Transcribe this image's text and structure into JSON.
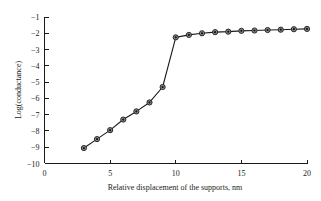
{
  "chart_data": {
    "type": "line",
    "title": "",
    "xlabel": "Relative displacement of the supports, nm",
    "ylabel": "Log(conductance)",
    "xlim": [
      0,
      20
    ],
    "ylim": [
      -10,
      -1
    ],
    "xticks": [
      0,
      5,
      10,
      15,
      20
    ],
    "xtick_labels": [
      "0",
      "5",
      "10",
      "15",
      "20"
    ],
    "yticks": [
      -1,
      -2,
      -3,
      -4,
      -5,
      -6,
      -7,
      -8,
      -9,
      -10
    ],
    "ytick_labels": [
      "−1",
      "−2",
      "−3",
      "−4",
      "−5",
      "−6",
      "−7",
      "−8",
      "−9",
      "−10"
    ],
    "grid": false,
    "legend": null,
    "marker": "circle",
    "x": [
      3,
      4,
      5,
      6,
      7,
      8,
      9,
      10,
      11,
      12,
      13,
      14,
      15,
      16,
      17,
      18,
      19,
      20
    ],
    "values": [
      -9.05,
      -8.5,
      -7.95,
      -7.3,
      -6.8,
      -6.25,
      -5.3,
      -2.25,
      -2.1,
      -2.0,
      -1.93,
      -1.9,
      -1.85,
      -1.83,
      -1.8,
      -1.78,
      -1.75,
      -1.73
    ],
    "series": [
      {
        "name": "conductance",
        "values": [
          -9.05,
          -8.5,
          -7.95,
          -7.3,
          -6.8,
          -6.25,
          -5.3,
          -2.25,
          -2.1,
          -2.0,
          -1.93,
          -1.9,
          -1.85,
          -1.83,
          -1.8,
          -1.78,
          -1.75,
          -1.73
        ]
      }
    ]
  },
  "colors": {
    "line": "#1a1a1a",
    "marker_fill": "#8c8c8c",
    "marker_edge": "#1a1a1a",
    "axis": "#1a1a1a",
    "background": "#ffffff"
  }
}
